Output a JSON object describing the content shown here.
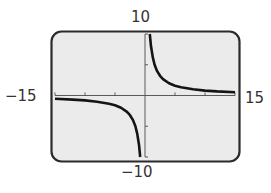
{
  "chart_data": {
    "type": "line",
    "title": "",
    "xlabel": "",
    "ylabel": "",
    "window": {
      "xmin": -15,
      "xmax": 15,
      "ymin": -10,
      "ymax": 10,
      "xscl": 5,
      "yscl": 5
    },
    "xlim": [
      -15,
      15
    ],
    "ylim": [
      -10,
      10
    ],
    "grid": false,
    "legend": null,
    "tick_labels": {
      "x_min": "−15",
      "x_max": "15",
      "y_min": "−10",
      "y_max": "10"
    },
    "x_ticks": [
      -10,
      -5,
      5,
      10
    ],
    "y_ticks": [
      -5,
      5
    ],
    "series": [
      {
        "name": "right-branch",
        "x": [
          0.8,
          1.0,
          1.3,
          1.6,
          2.0,
          2.5,
          3.0,
          4.0,
          5.0,
          6.0,
          8.0,
          10.0,
          12.0,
          15.0
        ],
        "y": [
          10.0,
          8.0,
          6.2,
          5.0,
          4.0,
          3.2,
          2.67,
          2.0,
          1.6,
          1.33,
          1.0,
          0.8,
          0.67,
          0.53
        ]
      },
      {
        "name": "left-branch",
        "x": [
          -15.0,
          -12.0,
          -10.0,
          -8.0,
          -6.0,
          -5.0,
          -4.0,
          -3.0,
          -2.5,
          -2.0,
          -1.6,
          -1.3,
          -1.0,
          -0.8
        ],
        "y": [
          -0.53,
          -0.67,
          -0.8,
          -1.0,
          -1.33,
          -1.6,
          -2.0,
          -2.67,
          -3.2,
          -4.0,
          -5.0,
          -6.2,
          -8.0,
          -10.0
        ]
      }
    ],
    "asymptotes": {
      "vertical": 0,
      "horizontal": 0
    }
  },
  "labels": {
    "ymax": "10",
    "ymin": "−10",
    "xmin": "−15",
    "xmax": "15"
  },
  "colors": {
    "screen_fill": "#ebebeb",
    "frame": "#2b2b2b",
    "axis": "#5a5a5a",
    "curve": "#141414"
  }
}
